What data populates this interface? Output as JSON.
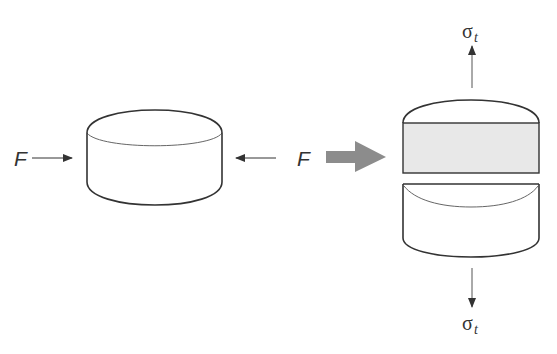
{
  "diagram": {
    "left_specimen": {
      "force_left_label": "F",
      "force_right_label": "F"
    },
    "transition_arrow": {
      "color": "#8c8c8c"
    },
    "right_specimen": {
      "top_stress_label": {
        "symbol": "σ",
        "subscript": "t"
      },
      "bottom_stress_label": {
        "symbol": "σ",
        "subscript": "t"
      },
      "fracture_face_color": "#e8e8e8"
    },
    "colors": {
      "stroke": "#333333",
      "thin_stroke": "#555555"
    }
  }
}
